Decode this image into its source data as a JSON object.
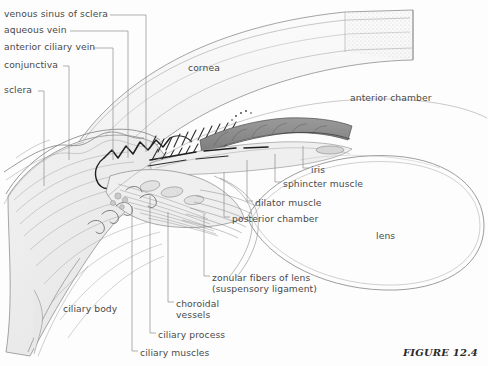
{
  "figure": {
    "caption": "FIGURE 12.4",
    "background_color": "#fdfdfd",
    "label_color": "#4a4a4a",
    "leader_color": "#8d8d8d",
    "ink_color": "#6f6f6f",
    "iris_fill": "#8e8e8e"
  },
  "leader_labels": [
    {
      "id": "venous-sinus-of-sclera",
      "text": "venous sinus of sclera",
      "x": 4,
      "y": 9
    },
    {
      "id": "aqueous-vein",
      "text": "aqueous vein",
      "x": 4,
      "y": 25
    },
    {
      "id": "anterior-ciliary-vein",
      "text": "anterior ciliary vein",
      "x": 4,
      "y": 42
    },
    {
      "id": "conjunctiva",
      "text": "conjunctiva",
      "x": 4,
      "y": 60
    },
    {
      "id": "sclera",
      "text": "sclera",
      "x": 4,
      "y": 85
    },
    {
      "id": "iris",
      "text": "iris",
      "x": 311,
      "y": 165
    },
    {
      "id": "sphincter-muscle",
      "text": "sphincter muscle",
      "x": 283,
      "y": 179
    },
    {
      "id": "dilator-muscle",
      "text": "dilator muscle",
      "x": 255,
      "y": 198
    },
    {
      "id": "posterior-chamber",
      "text": "posterior chamber",
      "x": 232,
      "y": 214
    },
    {
      "id": "zonular-fibers-of-lens",
      "text": "zonular fibers of lens\n(suspensory ligament)",
      "x": 212,
      "y": 273
    },
    {
      "id": "choroidal-vessels",
      "text": "choroidal\nvessels",
      "x": 176,
      "y": 299
    },
    {
      "id": "ciliary-process",
      "text": "ciliary process",
      "x": 158,
      "y": 330
    },
    {
      "id": "ciliary-muscles",
      "text": "ciliary muscles",
      "x": 140,
      "y": 348
    }
  ],
  "plain_labels": [
    {
      "id": "cornea",
      "text": "cornea",
      "x": 188,
      "y": 63
    },
    {
      "id": "anterior-chamber",
      "text": "anterior chamber",
      "x": 350,
      "y": 93
    },
    {
      "id": "ciliary-body",
      "text": "ciliary body",
      "x": 63,
      "y": 304
    },
    {
      "id": "lens",
      "text": "lens",
      "x": 376,
      "y": 231
    }
  ]
}
